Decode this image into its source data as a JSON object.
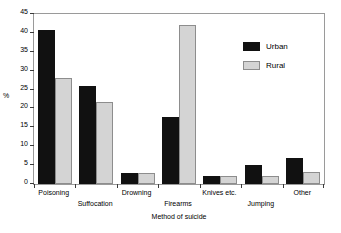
{
  "chart_data": {
    "type": "bar",
    "title": "",
    "xlabel": "Method of suicide",
    "ylabel": "%",
    "categories": [
      "Poisoning",
      "Suffocation",
      "Drowning",
      "Firearms",
      "Knives etc.",
      "Jumping",
      "Other"
    ],
    "series": [
      {
        "name": "Urban",
        "color": "#111111",
        "values": [
          40.7,
          26.0,
          3.0,
          17.8,
          2.0,
          5.0,
          7.0
        ]
      },
      {
        "name": "Rural",
        "color": "#d4d4d4",
        "values": [
          28.0,
          21.8,
          3.0,
          42.0,
          2.0,
          2.0,
          3.2
        ]
      }
    ],
    "ylim": [
      0,
      45
    ],
    "yticks": [
      0,
      5,
      10,
      15,
      20,
      25,
      30,
      35,
      40,
      45
    ],
    "ytick_labels": [
      "0",
      "5",
      "10",
      "15",
      "20",
      "25",
      "30",
      "35",
      "40",
      "45"
    ],
    "grid": false,
    "legend_position": "upper right",
    "legend_entries": [
      "Urban",
      "Rural"
    ],
    "label_stagger": [
      0,
      1,
      0,
      1,
      0,
      1,
      0
    ]
  }
}
